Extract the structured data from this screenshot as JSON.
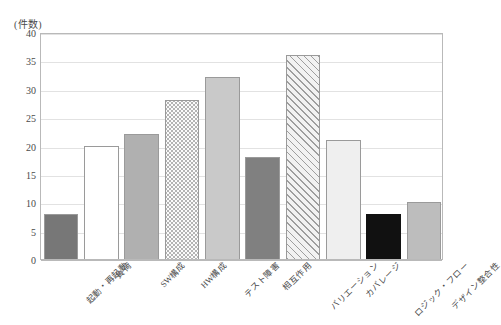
{
  "chart_data": {
    "type": "bar",
    "title": "",
    "subtitle": "",
    "xlabel": "",
    "ylabel": "(件数)",
    "ylim": [
      0,
      40
    ],
    "ytick_step": 5,
    "yticks": [
      "0",
      "5",
      "10",
      "15",
      "20",
      "25",
      "30",
      "35",
      "40"
    ],
    "grid": true,
    "legend": "none",
    "categories": [
      "起動・再起動",
      "負荷",
      "SW構成",
      "HW構成",
      "テスト障害",
      "相互作用",
      "バリエーション",
      "カバレージ",
      "ロジック・フロー",
      "デザイン整合性"
    ],
    "values": [
      8,
      20,
      22,
      28,
      32,
      18,
      36,
      21,
      8,
      10
    ],
    "bar_styles": [
      "solid-dark-gray",
      "solid-white",
      "solid-medium-gray",
      "dotted-pattern",
      "solid-light-gray",
      "solid-dark-gray",
      "diagonal-hatch",
      "solid-very-light-gray",
      "solid-black",
      "solid-medium-gray"
    ],
    "bar_colors": [
      "#777777",
      "#ffffff",
      "#b0b0b0",
      "#fbfbfb",
      "#c9c9c9",
      "#808080",
      "#f2f2f2",
      "#efefef",
      "#111111",
      "#bdbdbd"
    ]
  },
  "axis": {
    "unit_caption": "(件数)"
  },
  "colors": {
    "grid": "#e2e2e2",
    "frame": "#b9b9b9",
    "text": "#4a4a4a",
    "bar_border": "#9a9a9a"
  }
}
